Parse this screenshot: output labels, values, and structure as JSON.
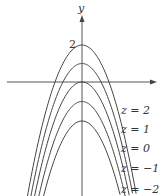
{
  "figure": {
    "axis_y_label": "y",
    "tick_label": "2",
    "colors": {
      "curve": "#444444",
      "axis": "#555555",
      "text": "#333333",
      "background": "#ffffff"
    },
    "level_curves": [
      {
        "label": "z = 2",
        "vertex_y": 45
      },
      {
        "label": "z = 1",
        "vertex_y": 63.5
      },
      {
        "label": "z = 0",
        "vertex_y": 82
      },
      {
        "label": "z = −1",
        "vertex_y": 101.5
      },
      {
        "label": "z = −2",
        "vertex_y": 121
      }
    ],
    "label_positions_y": [
      110,
      129,
      148,
      168,
      189
    ]
  },
  "chart_data": {
    "type": "line",
    "title": "",
    "xlabel": "",
    "ylabel": "y",
    "y_tick_labels": [
      "2"
    ],
    "series": [
      {
        "name": "z = 2",
        "vertex_y": 2
      },
      {
        "name": "z = 1",
        "vertex_y": 1
      },
      {
        "name": "z = 0",
        "vertex_y": 0
      },
      {
        "name": "z = −1",
        "vertex_y": -1
      },
      {
        "name": "z = −2",
        "vertex_y": -2
      }
    ],
    "grid": false,
    "legend": "inline labels on right"
  }
}
